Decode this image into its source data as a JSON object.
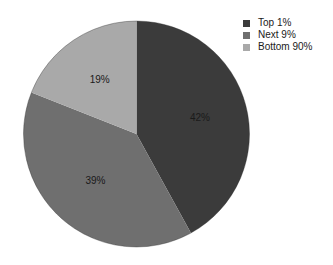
{
  "chart_data": {
    "type": "pie",
    "title": "",
    "categories": [
      "Top 1%",
      "Next 9%",
      "Bottom 90%"
    ],
    "values": [
      42,
      39,
      19
    ],
    "labels": [
      "42%",
      "39%",
      "19%"
    ],
    "colors": [
      "#3b3b3b",
      "#6f6f6f",
      "#a9a9a9"
    ],
    "start_angle": "12 o'clock",
    "direction": "clockwise",
    "legend_position": "top-right"
  },
  "legend": {
    "items": [
      {
        "label": "Top 1%",
        "color": "#3b3b3b"
      },
      {
        "label": "Next 9%",
        "color": "#6f6f6f"
      },
      {
        "label": "Bottom 90%",
        "color": "#a9a9a9"
      }
    ]
  }
}
